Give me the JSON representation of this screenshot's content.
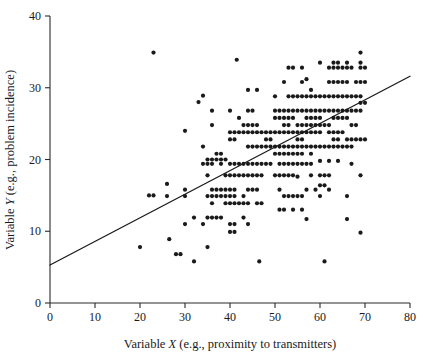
{
  "chart_data": {
    "type": "scatter",
    "title": "",
    "xlabel": "Variable X (e.g., proximity to transmitters)",
    "xlabel_parts": {
      "prefix": "Variable ",
      "variable": "X",
      "suffix": " (e.g., proximity to transmitters)"
    },
    "ylabel": "Variable Y (e.g., problem incidence)",
    "ylabel_parts": {
      "prefix": "Variable ",
      "variable": "Y",
      "suffix": " (e.g., problem incidence)"
    },
    "xlim": [
      0,
      80
    ],
    "ylim": [
      0,
      40
    ],
    "xticks": [
      0,
      10,
      20,
      30,
      40,
      50,
      60,
      70,
      80
    ],
    "xtick_labels": [
      "0",
      "10",
      "20",
      "30",
      "40",
      "50",
      "60",
      "70",
      "80"
    ],
    "yticks": [
      0,
      10,
      20,
      30,
      40
    ],
    "ytick_labels": [
      "0",
      "10",
      "20",
      "30",
      "40"
    ],
    "grid": false,
    "legend": "none",
    "point_color": "#1a1a1a",
    "point_radius": 2.1,
    "line_color": "#1a1a1a",
    "axis_color": "#2a2a2a",
    "background_color": "#ffffff",
    "trendline": {
      "type": "linear",
      "x_start": 0,
      "y_start": 5.3,
      "x_end": 80,
      "y_end": 31.6,
      "slope": 0.329,
      "intercept": 5.3
    },
    "points": [
      [
        20,
        7.8
      ],
      [
        22,
        15
      ],
      [
        23,
        15
      ],
      [
        23,
        34.9
      ],
      [
        26,
        16.6
      ],
      [
        26,
        14.9
      ],
      [
        26.5,
        8.9
      ],
      [
        28,
        6.8
      ],
      [
        29,
        6.8
      ],
      [
        30,
        15.8
      ],
      [
        30,
        14.9
      ],
      [
        30,
        24
      ],
      [
        30,
        11
      ],
      [
        32,
        5.8
      ],
      [
        32,
        11.9
      ],
      [
        33,
        28
      ],
      [
        34,
        28.9
      ],
      [
        34,
        21.8
      ],
      [
        34,
        19.4
      ],
      [
        34,
        11
      ],
      [
        35,
        20
      ],
      [
        35,
        19.4
      ],
      [
        35,
        17.8
      ],
      [
        35,
        14.9
      ],
      [
        35,
        11.9
      ],
      [
        35,
        7.8
      ],
      [
        36,
        20
      ],
      [
        36,
        26.8
      ],
      [
        36,
        24.8
      ],
      [
        36,
        19.4
      ],
      [
        36,
        15.8
      ],
      [
        36,
        14.9
      ],
      [
        36,
        13.9
      ],
      [
        36,
        11.9
      ],
      [
        37,
        20.8
      ],
      [
        37,
        20
      ],
      [
        37,
        15.8
      ],
      [
        37,
        14.9
      ],
      [
        37,
        11.9
      ],
      [
        38,
        20.8
      ],
      [
        38,
        20
      ],
      [
        38,
        19.4
      ],
      [
        38,
        15.8
      ],
      [
        38,
        14.9
      ],
      [
        38,
        11.9
      ],
      [
        39,
        20
      ],
      [
        39,
        17.8
      ],
      [
        39,
        15.8
      ],
      [
        39,
        14.9
      ],
      [
        39,
        13.9
      ],
      [
        40,
        26.8
      ],
      [
        40,
        23.8
      ],
      [
        40,
        22.8
      ],
      [
        40,
        19.4
      ],
      [
        40,
        17.8
      ],
      [
        40,
        15.8
      ],
      [
        40,
        14.9
      ],
      [
        40,
        13.9
      ],
      [
        40,
        11
      ],
      [
        40,
        9.9
      ],
      [
        41,
        23.8
      ],
      [
        41,
        22.8
      ],
      [
        41,
        19.4
      ],
      [
        41,
        17.8
      ],
      [
        41,
        15.8
      ],
      [
        41,
        14.9
      ],
      [
        41,
        13.9
      ],
      [
        41,
        11
      ],
      [
        41,
        9.9
      ],
      [
        41.5,
        33.9
      ],
      [
        42,
        25.8
      ],
      [
        42,
        23.8
      ],
      [
        42,
        19.4
      ],
      [
        42,
        17.8
      ],
      [
        42,
        13.9
      ],
      [
        43,
        24.8
      ],
      [
        43,
        23.8
      ],
      [
        43,
        19.4
      ],
      [
        43,
        17.8
      ],
      [
        43,
        14.9
      ],
      [
        43,
        13.9
      ],
      [
        43,
        11.9
      ],
      [
        44,
        29.7
      ],
      [
        44,
        26.8
      ],
      [
        44,
        24.8
      ],
      [
        44,
        23.8
      ],
      [
        44,
        21.8
      ],
      [
        44,
        19.4
      ],
      [
        44,
        17.8
      ],
      [
        44,
        15.8
      ],
      [
        44,
        13.9
      ],
      [
        44,
        11
      ],
      [
        45,
        26.8
      ],
      [
        45,
        24.8
      ],
      [
        45,
        23.8
      ],
      [
        45,
        21.8
      ],
      [
        45,
        19.4
      ],
      [
        45,
        17.8
      ],
      [
        45,
        15.8
      ],
      [
        46,
        29.7
      ],
      [
        46,
        24.8
      ],
      [
        46,
        23.8
      ],
      [
        46,
        21.8
      ],
      [
        46,
        19.4
      ],
      [
        46,
        17.8
      ],
      [
        46,
        15.8
      ],
      [
        46,
        13.9
      ],
      [
        46.5,
        5.8
      ],
      [
        47,
        23.8
      ],
      [
        47,
        21.8
      ],
      [
        47,
        19.4
      ],
      [
        47,
        17.8
      ],
      [
        47,
        13.9
      ],
      [
        48,
        23.8
      ],
      [
        48,
        22.8
      ],
      [
        48,
        21.8
      ],
      [
        48,
        19.4
      ],
      [
        49,
        23.8
      ],
      [
        49,
        22.8
      ],
      [
        49,
        21.8
      ],
      [
        49,
        19.4
      ],
      [
        50,
        28.8
      ],
      [
        50,
        26.8
      ],
      [
        50,
        25.8
      ],
      [
        50,
        23.8
      ],
      [
        50,
        21.8
      ],
      [
        50,
        20.8
      ],
      [
        50,
        17.8
      ],
      [
        51,
        26.8
      ],
      [
        51,
        25.8
      ],
      [
        51,
        23.8
      ],
      [
        51,
        21.8
      ],
      [
        51,
        20.8
      ],
      [
        51,
        19.4
      ],
      [
        51,
        17.8
      ],
      [
        51,
        15.8
      ],
      [
        51,
        13
      ],
      [
        52,
        30.8
      ],
      [
        52,
        26.8
      ],
      [
        52,
        25.8
      ],
      [
        52,
        24.8
      ],
      [
        52,
        23.8
      ],
      [
        52,
        21.8
      ],
      [
        52,
        20.8
      ],
      [
        52,
        19.4
      ],
      [
        52,
        17.8
      ],
      [
        52,
        14.9
      ],
      [
        52,
        13
      ],
      [
        53,
        32.8
      ],
      [
        53,
        28.8
      ],
      [
        53,
        26.8
      ],
      [
        53,
        25.8
      ],
      [
        53,
        24.8
      ],
      [
        53,
        23.8
      ],
      [
        53,
        21.8
      ],
      [
        53,
        20.8
      ],
      [
        53,
        19.4
      ],
      [
        53,
        17.8
      ],
      [
        53,
        14.9
      ],
      [
        54,
        32.8
      ],
      [
        54,
        28.8
      ],
      [
        54,
        26.8
      ],
      [
        54,
        25.8
      ],
      [
        54,
        23.8
      ],
      [
        54,
        21.8
      ],
      [
        54,
        20.8
      ],
      [
        54,
        19.4
      ],
      [
        54,
        17.8
      ],
      [
        54,
        14.9
      ],
      [
        54,
        13
      ],
      [
        55,
        28.8
      ],
      [
        55,
        26.8
      ],
      [
        55,
        24.8
      ],
      [
        55,
        23.8
      ],
      [
        55,
        22.8
      ],
      [
        55,
        21.8
      ],
      [
        55,
        20.8
      ],
      [
        55,
        19.4
      ],
      [
        55,
        17.6
      ],
      [
        55,
        14.9
      ],
      [
        56,
        32.8
      ],
      [
        56,
        30.8
      ],
      [
        56,
        28.8
      ],
      [
        56,
        26.8
      ],
      [
        56,
        24.8
      ],
      [
        56,
        23.8
      ],
      [
        56,
        22.8
      ],
      [
        56,
        21.8
      ],
      [
        56,
        20.8
      ],
      [
        56,
        19.4
      ],
      [
        56,
        14.9
      ],
      [
        56,
        13
      ],
      [
        57,
        31.2
      ],
      [
        57,
        28.8
      ],
      [
        57,
        26.8
      ],
      [
        57,
        25.8
      ],
      [
        57,
        24.8
      ],
      [
        57,
        23.8
      ],
      [
        57,
        21.8
      ],
      [
        57,
        19.4
      ],
      [
        57,
        15.8
      ],
      [
        57,
        11.7
      ],
      [
        58,
        29.7
      ],
      [
        58,
        28.8
      ],
      [
        58,
        26.8
      ],
      [
        58,
        25.8
      ],
      [
        58,
        24.8
      ],
      [
        58,
        23.8
      ],
      [
        58,
        21.8
      ],
      [
        58,
        20.8
      ],
      [
        58,
        19.4
      ],
      [
        58,
        17.8
      ],
      [
        59,
        28.8
      ],
      [
        59,
        26.8
      ],
      [
        59,
        25.8
      ],
      [
        59,
        24.8
      ],
      [
        59,
        23.8
      ],
      [
        59,
        21.8
      ],
      [
        59,
        15.8
      ],
      [
        60,
        33.5
      ],
      [
        60,
        28.8
      ],
      [
        60,
        26.8
      ],
      [
        60,
        25.8
      ],
      [
        60,
        24.8
      ],
      [
        60,
        23.8
      ],
      [
        60,
        21.8
      ],
      [
        60,
        19.8
      ],
      [
        60,
        17.8
      ],
      [
        60,
        16.4
      ],
      [
        60,
        14.9
      ],
      [
        61,
        5.8
      ],
      [
        61,
        28.8
      ],
      [
        61,
        26.8
      ],
      [
        61,
        24.8
      ],
      [
        61,
        21.8
      ],
      [
        61,
        17.8
      ],
      [
        61,
        16.4
      ],
      [
        62,
        32.8
      ],
      [
        62,
        30.8
      ],
      [
        62,
        28.8
      ],
      [
        62,
        26.8
      ],
      [
        62,
        24.8
      ],
      [
        62,
        23.8
      ],
      [
        62,
        21.8
      ],
      [
        62,
        19.8
      ],
      [
        62,
        17.8
      ],
      [
        62,
        15.8
      ],
      [
        63,
        33.5
      ],
      [
        63,
        32.8
      ],
      [
        63,
        30.8
      ],
      [
        63,
        28.8
      ],
      [
        63,
        26.8
      ],
      [
        63,
        25.8
      ],
      [
        63,
        23.8
      ],
      [
        63,
        22.8
      ],
      [
        63,
        21.8
      ],
      [
        64,
        33.5
      ],
      [
        64,
        32.8
      ],
      [
        64,
        30.8
      ],
      [
        64,
        28.8
      ],
      [
        64,
        26.8
      ],
      [
        64,
        25.8
      ],
      [
        64,
        23.8
      ],
      [
        64,
        22.8
      ],
      [
        64,
        21.8
      ],
      [
        64,
        19.8
      ],
      [
        65,
        32.8
      ],
      [
        65,
        30.8
      ],
      [
        65,
        28.8
      ],
      [
        65,
        26.8
      ],
      [
        65,
        25.8
      ],
      [
        65,
        23.8
      ],
      [
        65,
        21.8
      ],
      [
        66,
        33.5
      ],
      [
        66,
        32.8
      ],
      [
        66,
        30.8
      ],
      [
        66,
        28.8
      ],
      [
        66,
        26.8
      ],
      [
        66,
        25.8
      ],
      [
        66,
        22.8
      ],
      [
        66,
        21.8
      ],
      [
        66,
        14.9
      ],
      [
        66,
        11.7
      ],
      [
        67,
        32.8
      ],
      [
        67,
        28.8
      ],
      [
        67,
        26.8
      ],
      [
        67,
        24.8
      ],
      [
        67,
        22.8
      ],
      [
        67,
        21.8
      ],
      [
        67,
        19.4
      ],
      [
        68,
        30.8
      ],
      [
        68,
        28.8
      ],
      [
        68,
        26.8
      ],
      [
        68,
        24.8
      ],
      [
        68,
        22.8
      ],
      [
        69,
        34.9
      ],
      [
        69,
        33.5
      ],
      [
        69,
        32.8
      ],
      [
        69,
        30.8
      ],
      [
        69,
        28.8
      ],
      [
        69,
        27.9
      ],
      [
        69,
        26.8
      ],
      [
        69,
        22.8
      ],
      [
        69,
        17.8
      ],
      [
        69,
        9.8
      ],
      [
        70,
        32.8
      ],
      [
        70,
        30.8
      ],
      [
        70,
        27.9
      ],
      [
        70,
        22.8
      ]
    ]
  }
}
